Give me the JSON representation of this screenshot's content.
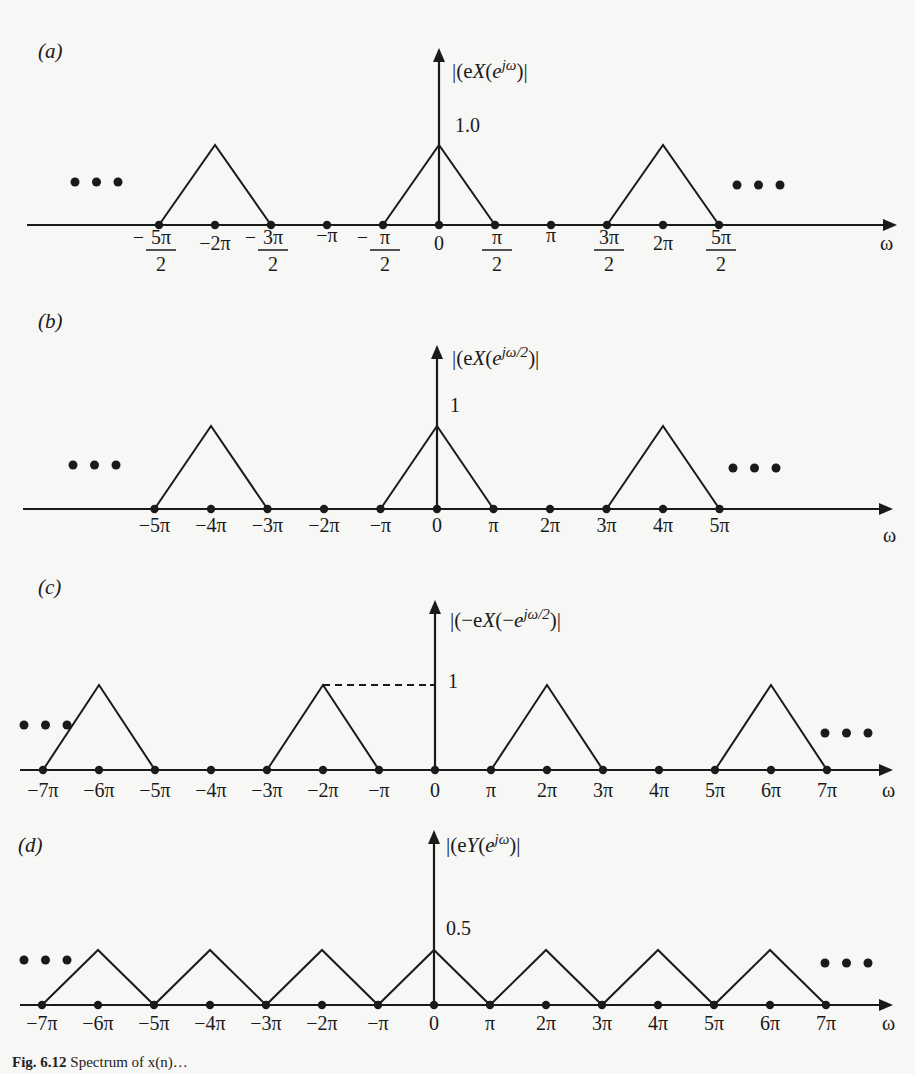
{
  "chart_data": [
    {
      "panel": "(a)",
      "type": "line",
      "title": "",
      "ylabel": "|X(e^{jω})|",
      "ylabel_parts": {
        "pre": "|X(e",
        "sup": "jω",
        "post": ")|"
      },
      "xlabel": "ω",
      "x_unit": "π",
      "xlim": [
        -3.2,
        3.5
      ],
      "ylim": [
        0,
        1.8
      ],
      "peak_label": "1.0",
      "continuation": "• • •",
      "ticks": [
        {
          "x": -2.5,
          "num": "5π",
          "den": "2",
          "sign": "−",
          "frac": true
        },
        {
          "x": -2.0,
          "label": "−2π"
        },
        {
          "x": -1.5,
          "num": "3π",
          "den": "2",
          "sign": "−",
          "frac": true
        },
        {
          "x": -1.0,
          "label": "−π"
        },
        {
          "x": -0.5,
          "num": "π",
          "den": "2",
          "sign": "−",
          "frac": true
        },
        {
          "x": 0,
          "label": "0"
        },
        {
          "x": 0.5,
          "num": "π",
          "den": "2",
          "sign": "",
          "frac": true
        },
        {
          "x": 1.0,
          "label": "π"
        },
        {
          "x": 1.5,
          "num": "3π",
          "den": "2",
          "sign": "",
          "frac": true
        },
        {
          "x": 2.0,
          "label": "2π"
        },
        {
          "x": 2.5,
          "num": "5π",
          "den": "2",
          "sign": "",
          "frac": true
        }
      ],
      "series": [
        {
          "name": "triangle at -2π",
          "x": [
            -2.5,
            -2.0,
            -1.5
          ],
          "y": [
            0,
            1.0,
            0
          ]
        },
        {
          "name": "triangle at 0",
          "x": [
            -0.5,
            0,
            0.5
          ],
          "y": [
            0,
            1.0,
            0
          ]
        },
        {
          "name": "triangle at 2π",
          "x": [
            1.5,
            2.0,
            2.5
          ],
          "y": [
            0,
            1.0,
            0
          ]
        }
      ],
      "dashed_ref": false
    },
    {
      "panel": "(b)",
      "type": "line",
      "ylabel": "|X(e^{jω/2})|",
      "ylabel_parts": {
        "pre": "|X(e",
        "sup": "jω/2",
        "post": ")|"
      },
      "xlabel": "ω",
      "x_unit": "π",
      "peak_label": "1",
      "continuation": "• • •",
      "ticks": [
        {
          "x": -5,
          "label": "−5π"
        },
        {
          "x": -4,
          "label": "−4π"
        },
        {
          "x": -3,
          "label": "−3π"
        },
        {
          "x": -2,
          "label": "−2π"
        },
        {
          "x": -1,
          "label": "−π"
        },
        {
          "x": 0,
          "label": "0"
        },
        {
          "x": 1,
          "label": "π"
        },
        {
          "x": 2,
          "label": "2π"
        },
        {
          "x": 3,
          "label": "3π"
        },
        {
          "x": 4,
          "label": "4π"
        },
        {
          "x": 5,
          "label": "5π"
        }
      ],
      "series": [
        {
          "name": "triangle at -4π",
          "x": [
            -5,
            -4,
            -3
          ],
          "y": [
            0,
            1,
            0
          ]
        },
        {
          "name": "triangle at 0",
          "x": [
            -1,
            0,
            1
          ],
          "y": [
            0,
            1,
            0
          ]
        },
        {
          "name": "triangle at 4π",
          "x": [
            3,
            4,
            5
          ],
          "y": [
            0,
            1,
            0
          ]
        }
      ],
      "dashed_ref": false
    },
    {
      "panel": "(c)",
      "type": "line",
      "ylabel": "|X(−e^{jω/2})|",
      "ylabel_parts": {
        "pre": "|X(−e",
        "sup": "jω/2",
        "post": ")|"
      },
      "xlabel": "ω",
      "x_unit": "π",
      "peak_label": "1",
      "continuation": "• • •",
      "ticks": [
        {
          "x": -7,
          "label": "−7π"
        },
        {
          "x": -6,
          "label": "−6π"
        },
        {
          "x": -5,
          "label": "−5π"
        },
        {
          "x": -4,
          "label": "−4π"
        },
        {
          "x": -3,
          "label": "−3π"
        },
        {
          "x": -2,
          "label": "−2π"
        },
        {
          "x": -1,
          "label": "−π"
        },
        {
          "x": 0,
          "label": "0"
        },
        {
          "x": 1,
          "label": "π"
        },
        {
          "x": 2,
          "label": "2π"
        },
        {
          "x": 3,
          "label": "3π"
        },
        {
          "x": 4,
          "label": "4π"
        },
        {
          "x": 5,
          "label": "5π"
        },
        {
          "x": 6,
          "label": "6π"
        },
        {
          "x": 7,
          "label": "7π"
        }
      ],
      "series": [
        {
          "name": "triangle at -6π",
          "x": [
            -7,
            -6,
            -5
          ],
          "y": [
            0,
            1,
            0
          ]
        },
        {
          "name": "triangle at -2π",
          "x": [
            -3,
            -2,
            -1
          ],
          "y": [
            0,
            1,
            0
          ]
        },
        {
          "name": "triangle at 2π",
          "x": [
            1,
            2,
            3
          ],
          "y": [
            0,
            1,
            0
          ]
        },
        {
          "name": "triangle at 6π",
          "x": [
            5,
            6,
            7
          ],
          "y": [
            0,
            1,
            0
          ]
        }
      ],
      "dashed_ref": true
    },
    {
      "panel": "(d)",
      "type": "line",
      "ylabel": "|Y(e^{jω})|",
      "ylabel_parts": {
        "pre": "|Y(e",
        "sup": "jω",
        "post": ")|"
      },
      "xlabel": "ω",
      "x_unit": "π",
      "peak_label": "0.5",
      "continuation": "• • •",
      "ticks": [
        {
          "x": -7,
          "label": "−7π"
        },
        {
          "x": -6,
          "label": "−6π"
        },
        {
          "x": -5,
          "label": "−5π"
        },
        {
          "x": -4,
          "label": "−4π"
        },
        {
          "x": -3,
          "label": "−3π"
        },
        {
          "x": -2,
          "label": "−2π"
        },
        {
          "x": -1,
          "label": "−π"
        },
        {
          "x": 0,
          "label": "0"
        },
        {
          "x": 1,
          "label": "π"
        },
        {
          "x": 2,
          "label": "2π"
        },
        {
          "x": 3,
          "label": "3π"
        },
        {
          "x": 4,
          "label": "4π"
        },
        {
          "x": 5,
          "label": "5π"
        },
        {
          "x": 6,
          "label": "6π"
        },
        {
          "x": 7,
          "label": "7π"
        }
      ],
      "series": [
        {
          "name": "periodic triangles, period 2π",
          "x": [
            -7,
            -6,
            -5,
            -4,
            -3,
            -2,
            -1,
            0,
            1,
            2,
            3,
            4,
            5,
            6,
            7
          ],
          "y": [
            0,
            0.5,
            0,
            0.5,
            0,
            0.5,
            0,
            0.5,
            0,
            0.5,
            0,
            0.5,
            0,
            0.5,
            0
          ]
        }
      ],
      "dashed_ref": false
    }
  ],
  "caption": {
    "bold": "Fig. 6.12",
    "text": "Spectrum of x(n)…"
  }
}
